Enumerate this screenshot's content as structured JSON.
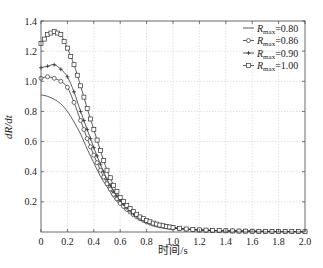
{
  "chart_data": {
    "type": "line",
    "title": "",
    "xlabel": "时间/s",
    "ylabel": "dR/dt",
    "xlim": [
      0,
      2.0
    ],
    "ylim": [
      0,
      1.4
    ],
    "xticks": [
      "0",
      "0.2",
      "0.4",
      "0.6",
      "0.8",
      "1.0",
      "1.2",
      "1.4",
      "1.6",
      "1.8",
      "2.0"
    ],
    "yticks": [
      "0.2",
      "0.4",
      "0.6",
      "0.8",
      "1.0",
      "1.2",
      "1.4"
    ],
    "grid": true,
    "legend_position": "upper right",
    "x": [
      0,
      0.05,
      0.1,
      0.15,
      0.2,
      0.25,
      0.3,
      0.35,
      0.4,
      0.45,
      0.5,
      0.55,
      0.6,
      0.65,
      0.7,
      0.75,
      0.8,
      0.85,
      0.9,
      0.95,
      1.0,
      1.1,
      1.2,
      1.3,
      1.4,
      1.5,
      1.6,
      1.7,
      1.8,
      1.9,
      2.0
    ],
    "series": [
      {
        "name": "Rmax=0.80",
        "marker": "none",
        "values": [
          0.91,
          0.9,
          0.88,
          0.85,
          0.8,
          0.73,
          0.65,
          0.55,
          0.46,
          0.37,
          0.3,
          0.23,
          0.18,
          0.14,
          0.11,
          0.085,
          0.065,
          0.05,
          0.04,
          0.032,
          0.026,
          0.018,
          0.013,
          0.01,
          0.008,
          0.006,
          0.005,
          0.004,
          0.003,
          0.003,
          0.002
        ]
      },
      {
        "name": "Rmax=0.86",
        "marker": "circle",
        "values": [
          1.02,
          1.03,
          1.02,
          1.0,
          0.96,
          0.86,
          0.74,
          0.62,
          0.51,
          0.41,
          0.32,
          0.25,
          0.19,
          0.15,
          0.115,
          0.088,
          0.067,
          0.052,
          0.041,
          0.033,
          0.027,
          0.018,
          0.013,
          0.01,
          0.008,
          0.006,
          0.005,
          0.004,
          0.003,
          0.003,
          0.002
        ]
      },
      {
        "name": "Rmax=0.90",
        "marker": "plus",
        "values": [
          1.09,
          1.1,
          1.11,
          1.08,
          1.03,
          0.93,
          0.8,
          0.68,
          0.56,
          0.45,
          0.35,
          0.27,
          0.21,
          0.16,
          0.12,
          0.092,
          0.07,
          0.054,
          0.042,
          0.034,
          0.028,
          0.019,
          0.013,
          0.01,
          0.008,
          0.006,
          0.005,
          0.004,
          0.003,
          0.003,
          0.002
        ]
      },
      {
        "name": "Rmax=1.00",
        "marker": "square",
        "values": [
          1.25,
          1.31,
          1.33,
          1.31,
          1.22,
          1.11,
          0.97,
          0.82,
          0.68,
          0.54,
          0.41,
          0.31,
          0.23,
          0.175,
          0.135,
          0.1,
          0.077,
          0.059,
          0.046,
          0.037,
          0.03,
          0.02,
          0.014,
          0.011,
          0.008,
          0.006,
          0.005,
          0.004,
          0.003,
          0.003,
          0.002
        ]
      }
    ]
  },
  "legend": {
    "items": [
      {
        "sym": "R",
        "sub": "max",
        "val": "=0.80"
      },
      {
        "sym": "R",
        "sub": "max",
        "val": "=0.86"
      },
      {
        "sym": "R",
        "sub": "max",
        "val": "=0.90"
      },
      {
        "sym": "R",
        "sub": "max",
        "val": "=1.00"
      }
    ]
  },
  "axes": {
    "xlabel": "时间/s",
    "ylabel_italic": "dR/dt"
  },
  "colors": {
    "line": "#333333",
    "grid": "#cfcfcf",
    "axis": "#444444"
  }
}
